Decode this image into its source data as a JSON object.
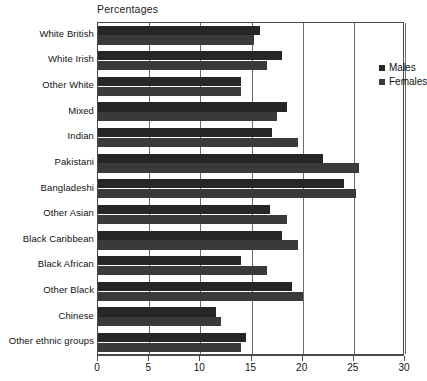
{
  "axis_title": "Percentages",
  "legend": {
    "position": "inside-top-right",
    "entries": [
      {
        "label": "Males",
        "color": "#262626",
        "icon": "square-swatch-icon"
      },
      {
        "label": "Females",
        "color": "#3a3a3a",
        "icon": "square-swatch-icon"
      }
    ]
  },
  "xaxis": {
    "ticks": [
      "0",
      "5",
      "10",
      "15",
      "20",
      "25",
      "30"
    ],
    "min": 0,
    "max": 30
  },
  "chart_data": {
    "type": "bar",
    "orientation": "horizontal",
    "title": "",
    "subtitle": "",
    "xlabel": "Percentages",
    "ylabel": "",
    "xlim": [
      0,
      30
    ],
    "xticks": [
      0,
      5,
      10,
      15,
      20,
      25,
      30
    ],
    "grid": true,
    "legend_position": "inside-top-right",
    "categories": [
      "White British",
      "White Irish",
      "Other White",
      "Mixed",
      "Indian",
      "Pakistani",
      "Bangladeshi",
      "Other Asian",
      "Black Caribbean",
      "Black African",
      "Other Black",
      "Chinese",
      "Other ethnic groups"
    ],
    "series": [
      {
        "name": "Males",
        "color": "#262626",
        "values": [
          15.8,
          18.0,
          14.0,
          18.5,
          17.0,
          22.0,
          24.0,
          16.8,
          18.0,
          14.0,
          19.0,
          11.5,
          14.5
        ]
      },
      {
        "name": "Females",
        "color": "#3a3a3a",
        "values": [
          15.2,
          16.5,
          14.0,
          17.5,
          19.5,
          25.5,
          25.2,
          18.5,
          19.5,
          16.5,
          20.0,
          12.0,
          14.0
        ]
      }
    ]
  }
}
